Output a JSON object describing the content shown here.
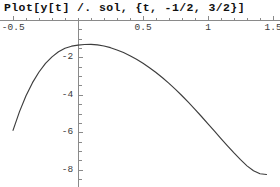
{
  "window": {
    "background": "#ffffff"
  },
  "input_cell": {
    "label": "Plot[y[t] /. sol, {t, -1/2, 3/2}]"
  },
  "chart_data": {
    "type": "line",
    "title": "",
    "xlabel": "",
    "ylabel": "",
    "xlim": [
      -0.55,
      1.55
    ],
    "ylim": [
      -8.4,
      0.35
    ],
    "grid": false,
    "legend": null,
    "axis_color": "#8a8a8a",
    "curve_color": "#3d3d3d",
    "x_axis_position": "top",
    "xticks": [
      -0.5,
      0.5,
      1,
      1.5
    ],
    "xtick_labels": [
      "-0.5",
      "0.5",
      "1",
      "1.5"
    ],
    "yticks": [
      -2,
      -4,
      -6,
      -8
    ],
    "ytick_labels": [
      "-2",
      "-4",
      "-6",
      "-8"
    ],
    "x_minor_tick_step": 0.1,
    "y_minor_tick_step": 0.5,
    "series": [
      {
        "name": "y[t] /. sol",
        "x": [
          -0.5,
          -0.45,
          -0.4,
          -0.35,
          -0.3,
          -0.25,
          -0.2,
          -0.15,
          -0.1,
          -0.05,
          0.0,
          0.05,
          0.1,
          0.15,
          0.2,
          0.25,
          0.3,
          0.35,
          0.4,
          0.45,
          0.5,
          0.55,
          0.6,
          0.65,
          0.7,
          0.75,
          0.8,
          0.85,
          0.9,
          0.95,
          1.0,
          1.05,
          1.1,
          1.15,
          1.2,
          1.25,
          1.3,
          1.35,
          1.4,
          1.45
        ],
        "y": [
          -5.9,
          -4.9,
          -4.05,
          -3.35,
          -2.78,
          -2.32,
          -1.97,
          -1.7,
          -1.51,
          -1.4,
          -1.34,
          -1.31,
          -1.3,
          -1.33,
          -1.39,
          -1.48,
          -1.6,
          -1.74,
          -1.91,
          -2.1,
          -2.31,
          -2.55,
          -2.81,
          -3.09,
          -3.39,
          -3.71,
          -4.05,
          -4.41,
          -4.78,
          -5.16,
          -5.55,
          -5.94,
          -6.34,
          -6.73,
          -7.11,
          -7.47,
          -7.8,
          -8.06,
          -8.22,
          -8.26
        ]
      }
    ]
  }
}
